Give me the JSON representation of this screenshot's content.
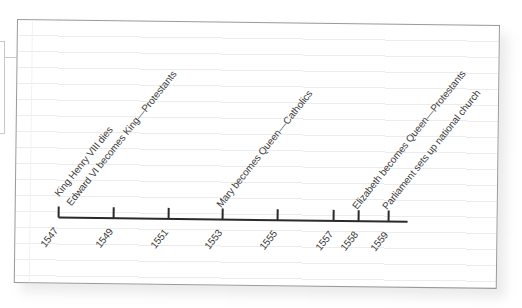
{
  "timeline": {
    "axis": {
      "start_year": 1547,
      "end_year": 1559,
      "line_color": "#2a2a2a"
    },
    "ticks": [
      {
        "year": "1547",
        "x": 43
      },
      {
        "year": "1549",
        "x": 98
      },
      {
        "year": "1551",
        "x": 153
      },
      {
        "year": "1553",
        "x": 207
      },
      {
        "year": "1555",
        "x": 262
      },
      {
        "year": "1557",
        "x": 318
      },
      {
        "year": "1558",
        "x": 343
      },
      {
        "year": "1559",
        "x": 373
      }
    ],
    "events": [
      {
        "year": "1547",
        "label": "King Henry VIII dies"
      },
      {
        "year": "1547",
        "label": "Edward VI becomes King—Protestants"
      },
      {
        "year": "1553",
        "label": "Mary becomes Queen—Catholics"
      },
      {
        "year": "1558",
        "label": "Elizabeth becomes Queen—Protestants"
      },
      {
        "year": "1559",
        "label": "Parliament sets up national church"
      }
    ]
  },
  "colors": {
    "paper": "#ffffff",
    "paper_border": "#9a9a9a",
    "rule_lines": "#ececec",
    "text": "#3a3a3a"
  }
}
